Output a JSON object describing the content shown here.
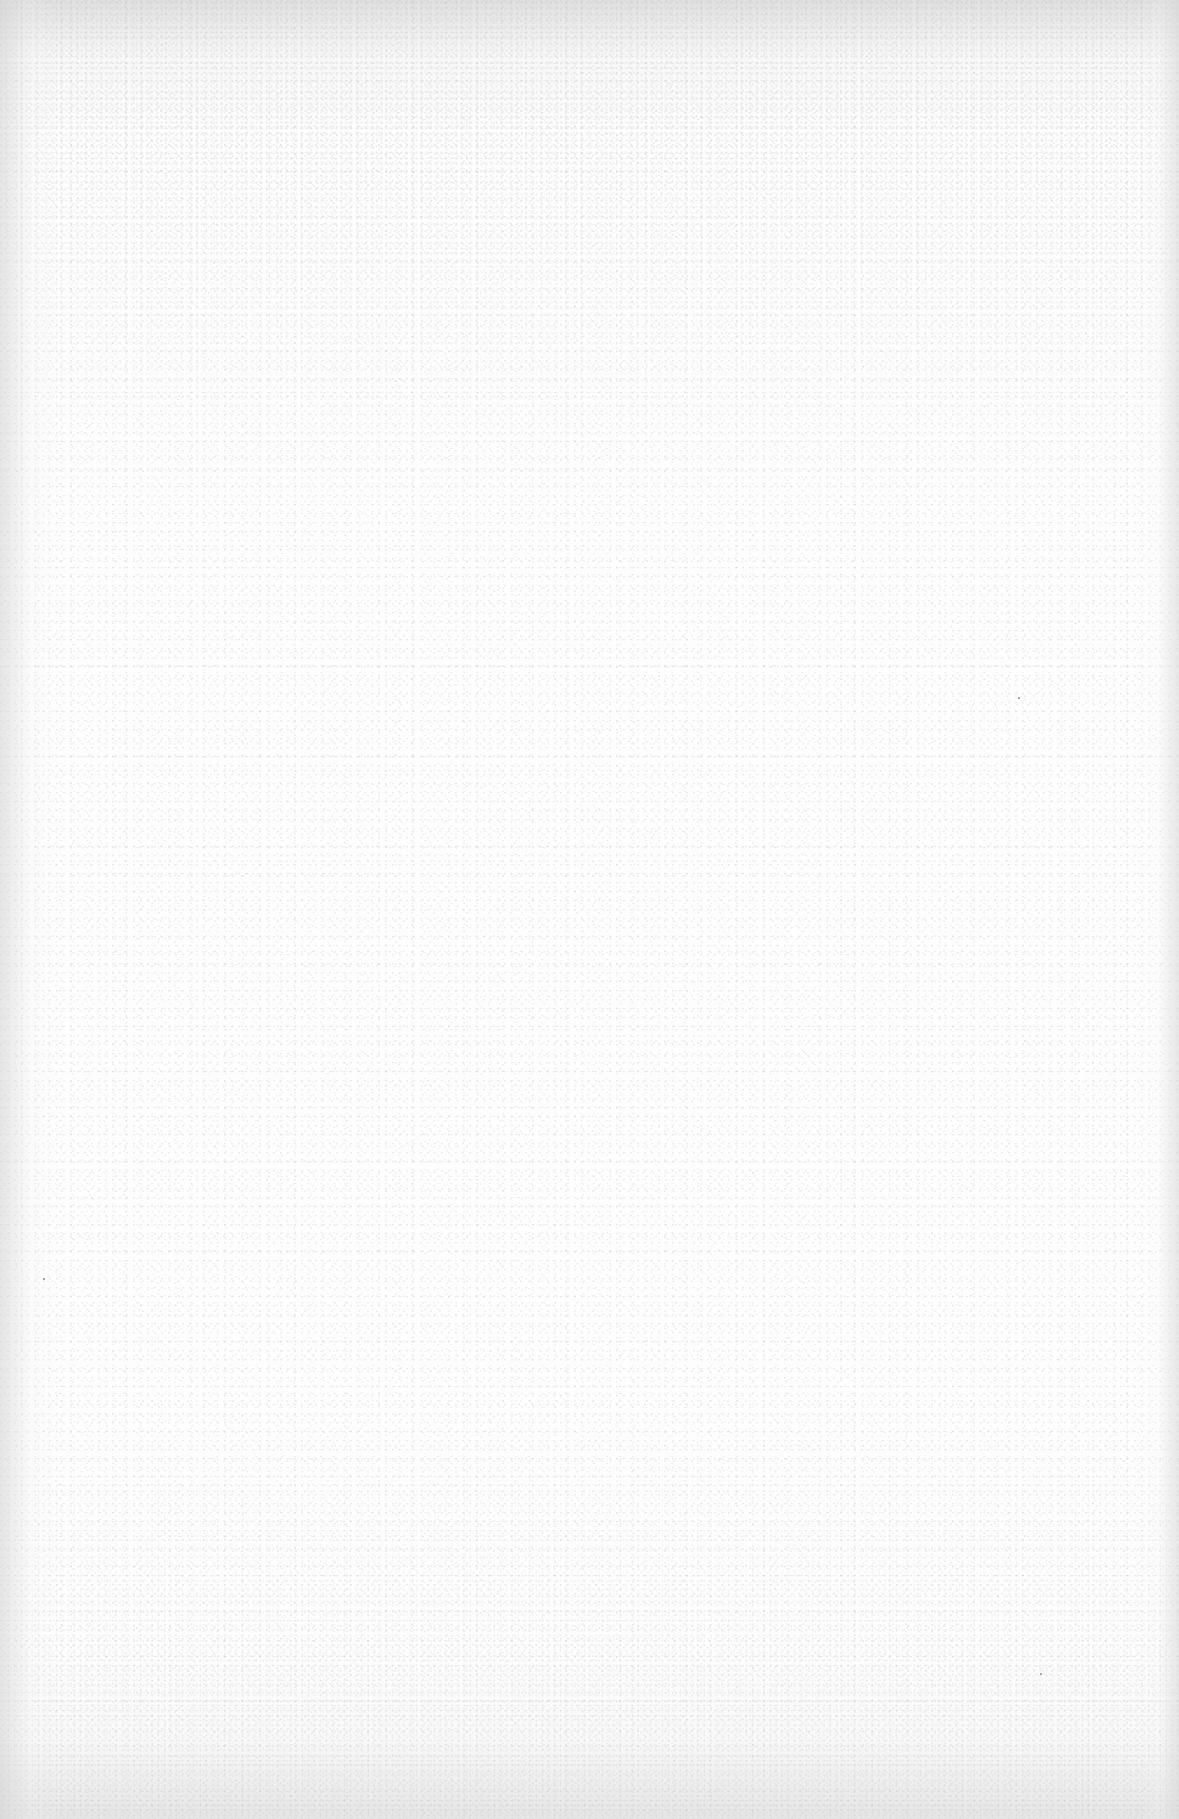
{
  "page": {
    "type": "blank-scanned-sheet",
    "content": "",
    "paper_color": "#fdfdfd",
    "edge_shadow_color": "#cdcdcd",
    "speck_color": "#8a8a8a"
  }
}
